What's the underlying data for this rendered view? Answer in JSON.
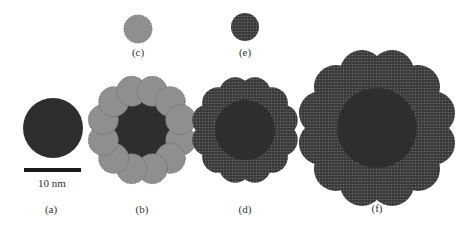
{
  "figure": {
    "panels": [
      {
        "id": "a",
        "label": "(a)",
        "description": "bare core nanoparticle"
      },
      {
        "id": "b",
        "label": "(b)",
        "description": "core with 12 gray satellite particles"
      },
      {
        "id": "c",
        "label": "(c)",
        "description": "single gray satellite particle"
      },
      {
        "id": "d",
        "label": "(d)",
        "description": "core with 12 dark textured satellite particles"
      },
      {
        "id": "e",
        "label": "(e)",
        "description": "single dark textured satellite particle"
      },
      {
        "id": "f",
        "label": "(f)",
        "description": "larger core with 12 large dark textured satellite particles"
      }
    ],
    "scale_bar": {
      "label": "10 nm"
    },
    "colors": {
      "core": "#2e2e2e",
      "gray_satellite": "#8f8f8f",
      "gray_satellite_edge": "#6e6e6e",
      "dark_satellite": "#3a3a3a",
      "dark_satellite_dot": "#6a6a6a",
      "label": "#333333"
    }
  }
}
